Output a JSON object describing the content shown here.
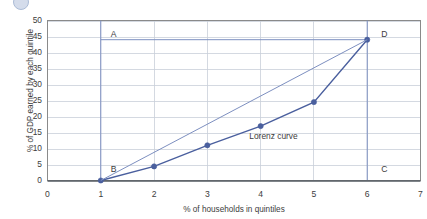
{
  "chart_data": {
    "type": "line",
    "title": "",
    "xlabel": "% of households in quintiles",
    "ylabel": "% of GDP earned by each quintile",
    "xlim": [
      0,
      7
    ],
    "ylim": [
      0,
      50
    ],
    "xticks": [
      "0",
      "1",
      "2",
      "3",
      "4",
      "5",
      "6",
      "7"
    ],
    "yticks": [
      "0",
      "5",
      "10",
      "15",
      "20",
      "25",
      "30",
      "35",
      "40",
      "45",
      "50"
    ],
    "grid": true,
    "legend_position": "none",
    "series": [
      {
        "name": "Lorenz curve",
        "color": "#4a5f9e",
        "x": [
          1,
          2,
          3,
          4,
          5,
          6
        ],
        "values": [
          0,
          4.4,
          11,
          17,
          24.5,
          44
        ],
        "markers": true
      },
      {
        "name": "Line of equality",
        "color": "#7d8fc0",
        "x": [
          1,
          6
        ],
        "values": [
          0,
          44
        ],
        "markers": false
      }
    ],
    "reference_lines": {
      "top_horizontal": {
        "y": 44,
        "x_from": 1,
        "x_to": 6,
        "color": "#7d8fc0"
      },
      "left_vertical": {
        "x": 1,
        "y_from": 0,
        "y_to": 50,
        "color": "#7d8fc0"
      },
      "right_vertical": {
        "x": 6,
        "y_from": 0,
        "y_to": 50,
        "color": "#7d8fc0"
      }
    },
    "annotations": [
      {
        "id": "A",
        "text": "A",
        "x": 1,
        "y": 45.5,
        "align": "left"
      },
      {
        "id": "B",
        "text": "B",
        "x": 1,
        "y": 3.2,
        "align": "left"
      },
      {
        "id": "C",
        "text": "C",
        "x": 6,
        "y": 3.2,
        "align": "right"
      },
      {
        "id": "D",
        "text": "D",
        "x": 6,
        "y": 45.5,
        "align": "right"
      },
      {
        "id": "curve",
        "text": "Lorenz curve",
        "x": 4.35,
        "y": 14.0,
        "align": "center"
      }
    ]
  },
  "decor": {
    "icon": "circle-icon"
  }
}
